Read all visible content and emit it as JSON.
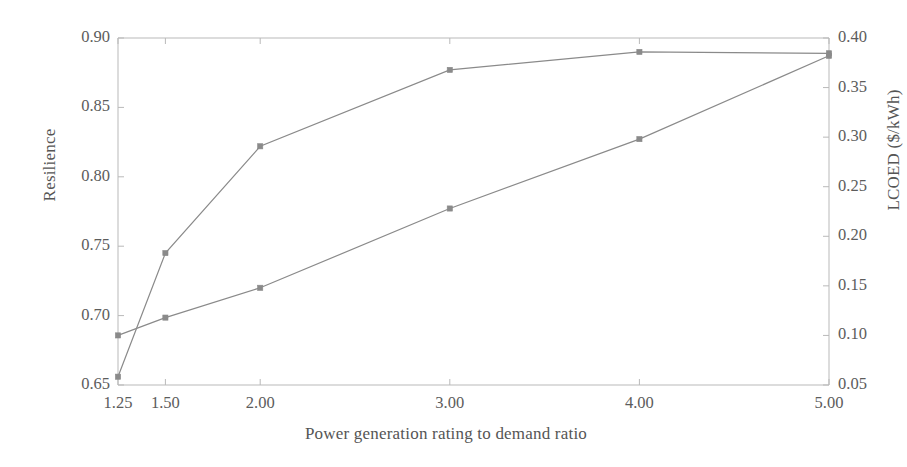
{
  "chart_data": {
    "type": "line",
    "title": "",
    "xlabel": "Power generation rating to demand ratio",
    "ylabel": "Resilience",
    "ylabel_right": "LCOED ($/kWh)",
    "x": [
      1.25,
      1.5,
      2.0,
      3.0,
      4.0,
      5.0
    ],
    "xtick_labels": [
      "1.25",
      "1.50",
      "2.00",
      "3.00",
      "4.00",
      "5.00"
    ],
    "xlim": [
      1.25,
      5.0
    ],
    "ylim": [
      0.65,
      0.9
    ],
    "ytick_labels": [
      "0.65",
      "0.70",
      "0.75",
      "0.80",
      "0.85",
      "0.90"
    ],
    "ytick_values": [
      0.65,
      0.7,
      0.75,
      0.8,
      0.85,
      0.9
    ],
    "ylim_right": [
      0.05,
      0.4
    ],
    "ytick_labels_right": [
      "0.05",
      "0.10",
      "0.15",
      "0.20",
      "0.25",
      "0.30",
      "0.35",
      "0.40"
    ],
    "ytick_values_right": [
      0.05,
      0.1,
      0.15,
      0.2,
      0.25,
      0.3,
      0.35,
      0.4
    ],
    "grid": false,
    "legend": "none",
    "series": [
      {
        "name": "Resilience",
        "axis": "left",
        "color": "#8a8a8a",
        "marker": "square",
        "values": [
          0.656,
          0.745,
          0.822,
          0.877,
          0.89,
          0.889
        ]
      },
      {
        "name": "LCOED ($/kWh)",
        "axis": "right",
        "color": "#8a8a8a",
        "marker": "square",
        "values": [
          0.1,
          0.118,
          0.148,
          0.228,
          0.298,
          0.382
        ]
      }
    ]
  }
}
